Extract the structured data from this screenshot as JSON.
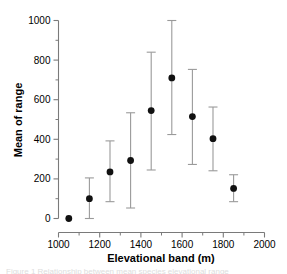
{
  "chart_data": {
    "type": "scatter",
    "title": "",
    "xlabel": "Elevational band (m)",
    "ylabel": "Mean of range",
    "xlim": [
      1000,
      2000
    ],
    "ylim": [
      0,
      1000
    ],
    "xticks": [
      1000,
      1200,
      1400,
      1600,
      1800,
      2000
    ],
    "xtick_labels": [
      "1000",
      "1200",
      "1400",
      "1600",
      "1800",
      "2000"
    ],
    "x_minor_tick_step": 100,
    "yticks": [
      0,
      200,
      400,
      600,
      800,
      1000
    ],
    "ytick_labels": [
      "0",
      "200",
      "400",
      "600",
      "800",
      "1000"
    ],
    "y_minor_tick_step": 100,
    "grid": false,
    "legend": null,
    "marker": "filled-circle",
    "marker_color": "#111111",
    "errorbar_color": "#9a9a9a",
    "axis_color": "#7a7a7a",
    "x": [
      1050,
      1150,
      1250,
      1350,
      1450,
      1550,
      1650,
      1750,
      1850
    ],
    "values": [
      0,
      100,
      235,
      293,
      545,
      710,
      515,
      403,
      152
    ],
    "err_low": [
      0,
      0,
      85,
      53,
      245,
      424,
      273,
      241,
      85
    ],
    "err_high": [
      0,
      205,
      392,
      534,
      840,
      1000,
      753,
      563,
      221
    ],
    "points": [
      {
        "x": 1050,
        "y": 0,
        "lower": 0,
        "upper": 0,
        "has_errorbar": false
      },
      {
        "x": 1150,
        "y": 100,
        "lower": 0,
        "upper": 205,
        "has_errorbar": true
      },
      {
        "x": 1250,
        "y": 235,
        "lower": 85,
        "upper": 392,
        "has_errorbar": true
      },
      {
        "x": 1350,
        "y": 293,
        "lower": 53,
        "upper": 534,
        "has_errorbar": true
      },
      {
        "x": 1450,
        "y": 545,
        "lower": 245,
        "upper": 840,
        "has_errorbar": true
      },
      {
        "x": 1550,
        "y": 710,
        "lower": 424,
        "upper": 1000,
        "has_errorbar": true
      },
      {
        "x": 1650,
        "y": 515,
        "lower": 273,
        "upper": 753,
        "has_errorbar": true
      },
      {
        "x": 1750,
        "y": 403,
        "lower": 241,
        "upper": 563,
        "has_errorbar": true
      },
      {
        "x": 1850,
        "y": 152,
        "lower": 85,
        "upper": 221,
        "has_errorbar": true
      }
    ]
  },
  "caption": {
    "ghost_text": "Figure 1 Relationship between mean species elevational range"
  }
}
